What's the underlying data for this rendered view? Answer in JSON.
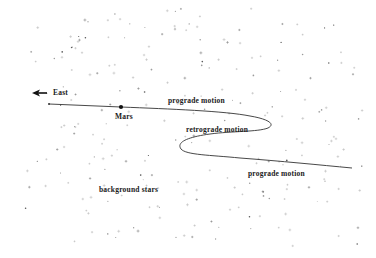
{
  "diagram": {
    "direction_label": "East",
    "planet_label": "Mars",
    "segments": [
      {
        "label": "prograde motion",
        "position": "upper"
      },
      {
        "label": "retrograde motion",
        "position": "middle"
      },
      {
        "label": "prograde motion",
        "position": "lower"
      }
    ],
    "background_label": "background stars",
    "colors": {
      "background": "#ffffff",
      "path": "#333333",
      "text": "#1a1a1a",
      "stars": "#9a9a9a"
    }
  }
}
